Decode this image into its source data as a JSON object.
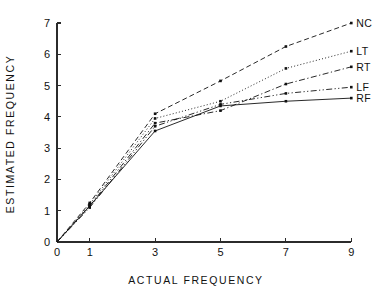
{
  "chart_data": {
    "type": "line",
    "title": "",
    "xlabel": "ACTUAL FREQUENCY",
    "ylabel": "ESTIMATED FREQUENCY",
    "x": [
      0,
      1,
      3,
      5,
      7,
      9
    ],
    "xlim": [
      0,
      9
    ],
    "ylim": [
      0,
      7
    ],
    "xticks": [
      0,
      1,
      3,
      5,
      7,
      9
    ],
    "xtick_labels": [
      "0",
      "1",
      "3",
      "5",
      "7",
      "9"
    ],
    "yticks": [
      0,
      1,
      2,
      3,
      4,
      5,
      6,
      7
    ],
    "ytick_labels": [
      "0",
      "1",
      "2",
      "3",
      "4",
      "5",
      "6",
      "7"
    ],
    "grid": false,
    "legend_position": "right-of-line-ends",
    "series": [
      {
        "name": "NC",
        "label": "NC",
        "linestyle": "dashed",
        "color": "#111111",
        "marker": "square",
        "values": [
          0,
          1.25,
          4.1,
          5.15,
          6.25,
          7.0
        ]
      },
      {
        "name": "LT",
        "label": "LT",
        "linestyle": "dotted",
        "color": "#111111",
        "marker": "square",
        "values": [
          0,
          1.2,
          3.95,
          4.5,
          5.55,
          6.1
        ]
      },
      {
        "name": "RT",
        "label": "RT",
        "linestyle": "dash-dot",
        "color": "#111111",
        "marker": "square",
        "values": [
          0,
          1.15,
          3.8,
          4.2,
          5.05,
          5.6
        ]
      },
      {
        "name": "LF",
        "label": "LF",
        "linestyle": "dash-dot-dot",
        "color": "#111111",
        "marker": "square",
        "values": [
          0,
          1.1,
          3.7,
          4.4,
          4.75,
          4.95
        ]
      },
      {
        "name": "RF",
        "label": "RF",
        "linestyle": "solid",
        "color": "#111111",
        "marker": "square",
        "values": [
          0,
          1.15,
          3.55,
          4.35,
          4.5,
          4.6
        ]
      }
    ]
  }
}
